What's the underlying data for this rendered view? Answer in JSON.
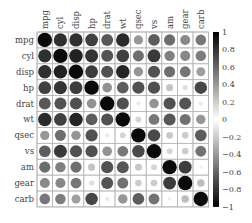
{
  "chart_data": {
    "type": "heatmap",
    "style": "correlation-circles",
    "title": "",
    "variables": [
      "mpg",
      "cyl",
      "disp",
      "hp",
      "drat",
      "wt",
      "qsec",
      "vs",
      "am",
      "gear",
      "carb"
    ],
    "matrix": [
      [
        1.0,
        -0.85,
        -0.85,
        -0.78,
        0.68,
        -0.87,
        0.42,
        0.66,
        0.6,
        0.48,
        -0.55
      ],
      [
        -0.85,
        1.0,
        0.9,
        0.83,
        -0.7,
        0.78,
        -0.59,
        -0.81,
        -0.52,
        -0.49,
        0.53
      ],
      [
        -0.85,
        0.9,
        1.0,
        0.79,
        -0.71,
        0.89,
        -0.43,
        -0.71,
        -0.59,
        -0.56,
        0.39
      ],
      [
        -0.78,
        0.83,
        0.79,
        1.0,
        -0.45,
        0.66,
        -0.71,
        -0.72,
        -0.24,
        -0.13,
        0.75
      ],
      [
        0.68,
        -0.7,
        -0.71,
        -0.45,
        1.0,
        -0.71,
        0.09,
        0.44,
        0.71,
        0.7,
        -0.09
      ],
      [
        -0.87,
        0.78,
        0.89,
        0.66,
        -0.71,
        1.0,
        -0.17,
        -0.55,
        -0.69,
        -0.58,
        0.43
      ],
      [
        0.42,
        -0.59,
        -0.43,
        -0.71,
        0.09,
        -0.17,
        1.0,
        0.74,
        -0.23,
        -0.21,
        -0.66
      ],
      [
        0.66,
        -0.81,
        -0.71,
        -0.72,
        0.44,
        -0.55,
        0.74,
        1.0,
        0.17,
        0.21,
        -0.57
      ],
      [
        0.6,
        -0.52,
        -0.59,
        -0.24,
        0.71,
        -0.69,
        -0.23,
        0.17,
        1.0,
        0.79,
        0.06
      ],
      [
        0.48,
        -0.49,
        -0.56,
        -0.13,
        0.7,
        -0.58,
        -0.21,
        0.21,
        0.79,
        1.0,
        0.27
      ],
      [
        -0.55,
        0.53,
        0.39,
        0.75,
        -0.09,
        0.43,
        -0.66,
        -0.57,
        0.06,
        0.27,
        1.0
      ]
    ],
    "colorbar": {
      "ticks": [
        "1",
        "0.8",
        "0.6",
        "0.4",
        "0.2",
        "0",
        "−0.2",
        "−0.4",
        "−0.6",
        "−0.8",
        "−1"
      ],
      "range": [
        -1,
        1
      ],
      "colors": [
        "#000000",
        "#ffffff",
        "#000000"
      ]
    },
    "xlabel": "",
    "ylabel": "",
    "grid": true,
    "legend_position": "right"
  }
}
